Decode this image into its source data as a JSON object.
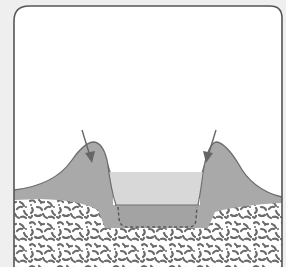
{
  "diagram": {
    "labels": [],
    "colors": {
      "page_background": "#efefef",
      "frame_fill": "#ffffff",
      "frame_stroke": "#555555",
      "mound_fill": "#a9a9a9",
      "mound_stroke": "#6e6e6e",
      "water_fill": "#d8d8d8",
      "basin_fill": "#a3a3a3",
      "dashed_outline": "#555555",
      "rock_background": "#ffffff",
      "rock_speckle": "#6a6a6a",
      "arrow": "#666666"
    },
    "elements": [
      {
        "name": "frame",
        "type": "rounded-rectangle"
      },
      {
        "name": "left-mound",
        "type": "earth-ridge"
      },
      {
        "name": "right-mound",
        "type": "earth-ridge"
      },
      {
        "name": "water-pool",
        "type": "water"
      },
      {
        "name": "original-pit-outline",
        "type": "dashed-line"
      },
      {
        "name": "rock-layer",
        "type": "speckled-texture"
      },
      {
        "name": "left-arrow",
        "type": "arrow",
        "direction": "down-right"
      },
      {
        "name": "right-arrow",
        "type": "arrow",
        "direction": "down-left"
      }
    ]
  }
}
